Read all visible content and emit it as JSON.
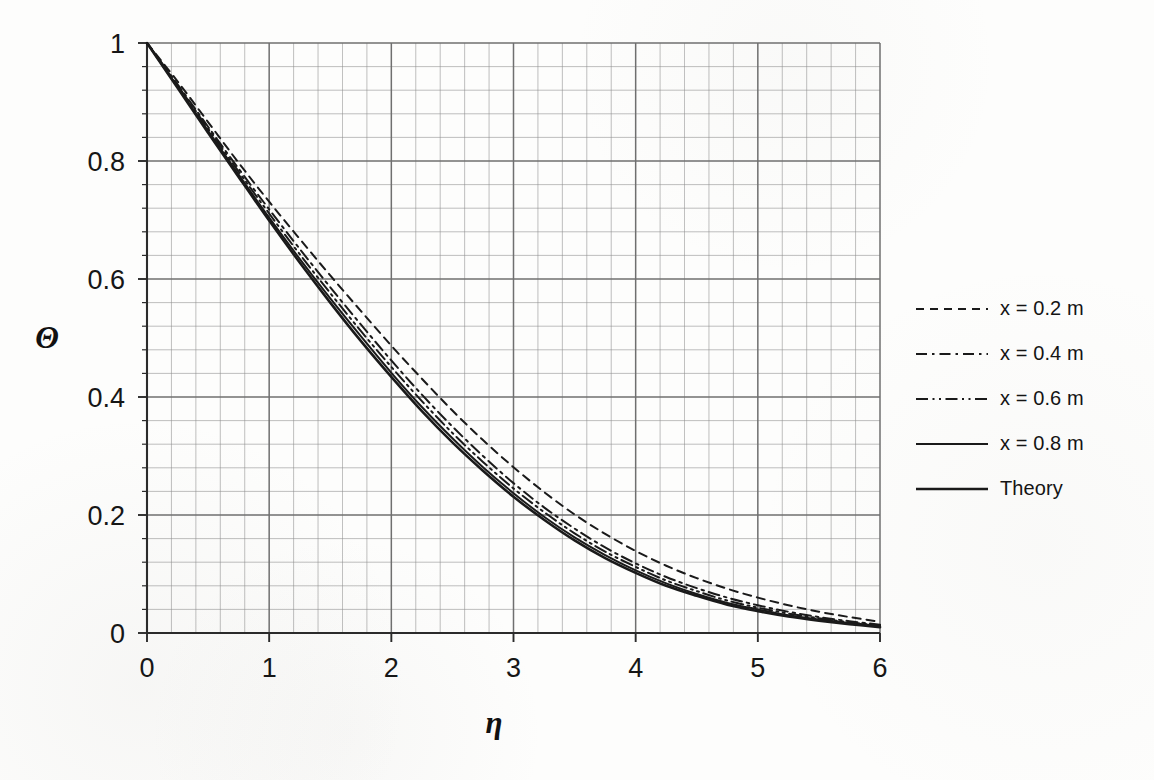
{
  "chart_data": {
    "type": "line",
    "title": "",
    "xlabel": "η",
    "ylabel": "Θ",
    "xlim": [
      0,
      6
    ],
    "ylim": [
      0,
      1
    ],
    "xticks": [
      "0",
      "1",
      "2",
      "3",
      "4",
      "5",
      "6"
    ],
    "yticks": [
      "0",
      "0.2",
      "0.4",
      "0.6",
      "0.8",
      "1"
    ],
    "x_major_step": 1,
    "x_minor_step": 0.2,
    "y_major_step": 0.2,
    "y_minor_step": 0.04,
    "grid": "major-and-minor",
    "legend_position": "right",
    "line_color": "#1a1a1a",
    "grid_color": "#8d8d8d",
    "axis_color": "#2b2b2b",
    "x": [
      0,
      0.25,
      0.5,
      0.75,
      1,
      1.25,
      1.5,
      1.75,
      2,
      2.25,
      2.5,
      2.75,
      3,
      3.25,
      3.5,
      3.75,
      4,
      4.25,
      4.5,
      4.75,
      5,
      5.25,
      5.5,
      5.75,
      6
    ],
    "series": [
      {
        "name": "x = 0.2 m",
        "dash": "8,6",
        "width": 2.0,
        "values": [
          1,
          0.935,
          0.866,
          0.797,
          0.731,
          0.668,
          0.606,
          0.546,
          0.487,
          0.431,
          0.377,
          0.327,
          0.281,
          0.239,
          0.201,
          0.168,
          0.139,
          0.114,
          0.093,
          0.075,
          0.06,
          0.047,
          0.036,
          0.027,
          0.019
        ]
      },
      {
        "name": "x = 0.4 m",
        "dash": "11,5,2.5,5",
        "width": 2.0,
        "values": [
          1,
          0.93,
          0.858,
          0.787,
          0.718,
          0.651,
          0.586,
          0.523,
          0.462,
          0.404,
          0.35,
          0.3,
          0.254,
          0.213,
          0.177,
          0.145,
          0.118,
          0.095,
          0.076,
          0.06,
          0.047,
          0.036,
          0.027,
          0.02,
          0.014
        ]
      },
      {
        "name": "x = 0.6 m",
        "dash": "12,4.5,2,4.5,2,4.5",
        "width": 2.0,
        "values": [
          1,
          0.928,
          0.855,
          0.782,
          0.711,
          0.642,
          0.576,
          0.512,
          0.451,
          0.393,
          0.339,
          0.29,
          0.245,
          0.205,
          0.169,
          0.138,
          0.112,
          0.089,
          0.071,
          0.055,
          0.043,
          0.033,
          0.025,
          0.018,
          0.013
        ]
      },
      {
        "name": "x = 0.8 m",
        "dash": "",
        "width": 2.0,
        "values": [
          1,
          0.926,
          0.851,
          0.777,
          0.704,
          0.634,
          0.567,
          0.503,
          0.441,
          0.383,
          0.33,
          0.281,
          0.237,
          0.197,
          0.162,
          0.132,
          0.106,
          0.084,
          0.066,
          0.051,
          0.04,
          0.03,
          0.023,
          0.017,
          0.012
        ]
      },
      {
        "name": "Theory",
        "dash": "",
        "width": 2.6,
        "values": [
          1,
          0.924,
          0.848,
          0.773,
          0.699,
          0.628,
          0.56,
          0.495,
          0.434,
          0.376,
          0.323,
          0.275,
          0.231,
          0.192,
          0.157,
          0.127,
          0.102,
          0.08,
          0.063,
          0.048,
          0.037,
          0.028,
          0.021,
          0.015,
          0.01
        ]
      }
    ]
  },
  "legend": {
    "items": [
      {
        "label": "x = 0.2 m"
      },
      {
        "label": "x = 0.4 m"
      },
      {
        "label": "x = 0.6 m"
      },
      {
        "label": "x = 0.8 m"
      },
      {
        "label": "Theory"
      }
    ]
  }
}
